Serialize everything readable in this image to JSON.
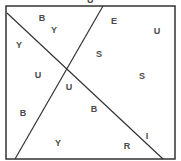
{
  "diagram": {
    "type": "partitioned-square-letter-puzzle",
    "top_partial_label": "U",
    "box": {
      "x": 6,
      "y": 6,
      "w": 169,
      "h": 153,
      "stroke": "#333333"
    },
    "lines": [
      {
        "name": "diagonal-1",
        "x1": 7,
        "y1": 13,
        "x2": 163,
        "y2": 159
      },
      {
        "name": "diagonal-2",
        "x1": 103,
        "y1": 6,
        "x2": 15,
        "y2": 159
      }
    ],
    "labels": [
      {
        "text": "B",
        "x": 42,
        "y": 18
      },
      {
        "text": "Y",
        "x": 54,
        "y": 30
      },
      {
        "text": "E",
        "x": 114,
        "y": 21
      },
      {
        "text": "U",
        "x": 157,
        "y": 31
      },
      {
        "text": "Y",
        "x": 19,
        "y": 45
      },
      {
        "text": "S",
        "x": 99,
        "y": 54
      },
      {
        "text": "U",
        "x": 38,
        "y": 75
      },
      {
        "text": "S",
        "x": 142,
        "y": 76
      },
      {
        "text": "U",
        "x": 69,
        "y": 87
      },
      {
        "text": "B",
        "x": 94,
        "y": 109
      },
      {
        "text": "B",
        "x": 23,
        "y": 113
      },
      {
        "text": "I",
        "x": 147,
        "y": 136
      },
      {
        "text": "Y",
        "x": 58,
        "y": 143
      },
      {
        "text": "R",
        "x": 127,
        "y": 146
      }
    ]
  }
}
